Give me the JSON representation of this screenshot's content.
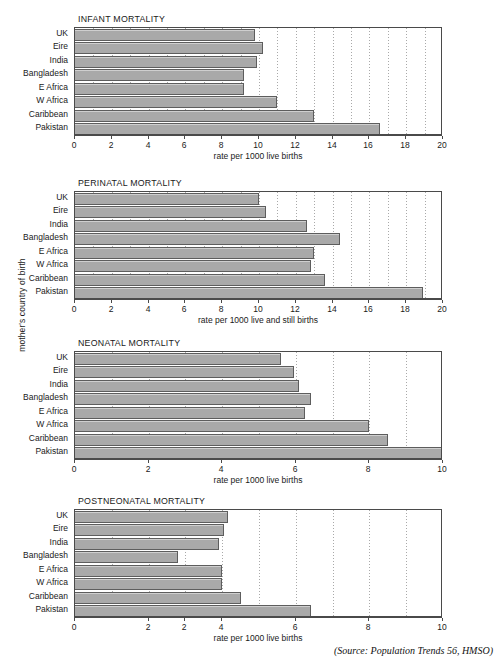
{
  "figure": {
    "y_axis_caption": "mother's country of birth",
    "source_note": "(Source: Population Trends 56, HMSO)",
    "bar_color": "#a9a9a9",
    "bar_border_color": "#5d5d5d",
    "grid_color": "#9a9a9a",
    "axis_color": "#4a4a4a"
  },
  "chart_data": [
    {
      "type": "bar",
      "orientation": "horizontal",
      "title": "INFANT MORTALITY",
      "xlabel": "rate per 1000 live births",
      "ylabel": "mother's country of birth",
      "categories": [
        "UK",
        "Eire",
        "India",
        "Bangladesh",
        "E Africa",
        "W Africa",
        "Caribbean",
        "Pakistan"
      ],
      "values": [
        9.8,
        10.2,
        9.9,
        9.2,
        9.2,
        11.0,
        13.0,
        16.6
      ],
      "xlim": [
        0,
        20
      ],
      "xticks": [
        0,
        2,
        4,
        6,
        8,
        10,
        12,
        14,
        16,
        18,
        20
      ],
      "xtick_labels": [
        "0",
        "2",
        "4",
        "6",
        "8",
        "10",
        "12",
        "14",
        "16",
        "18",
        "20"
      ],
      "grid": true,
      "legend": false
    },
    {
      "type": "bar",
      "orientation": "horizontal",
      "title": "PERINATAL MORTALITY",
      "xlabel": "rate per 1000 live and still births",
      "ylabel": "mother's country of birth",
      "categories": [
        "UK",
        "Eire",
        "India",
        "Bangladesh",
        "E Africa",
        "W Africa",
        "Caribbean",
        "Pakistan"
      ],
      "values": [
        10.0,
        10.4,
        12.6,
        14.4,
        13.0,
        12.85,
        13.6,
        18.9
      ],
      "xlim": [
        0,
        20
      ],
      "xticks": [
        0,
        2,
        4,
        6,
        8,
        10,
        12,
        14,
        16,
        18,
        20
      ],
      "xtick_labels": [
        "0",
        "2",
        "4",
        "6",
        "8",
        "10",
        "12",
        "14",
        "16",
        "18",
        "20"
      ],
      "grid": true,
      "legend": false
    },
    {
      "type": "bar",
      "orientation": "horizontal",
      "title": "NEONATAL MORTALITY",
      "xlabel": "rate per 1000 live births",
      "ylabel": "mother's country of birth",
      "categories": [
        "UK",
        "Eire",
        "India",
        "Bangladesh",
        "E Africa",
        "W Africa",
        "Caribbean",
        "Pakistan"
      ],
      "values": [
        5.6,
        5.95,
        6.1,
        6.4,
        6.25,
        8.0,
        8.5,
        10.1
      ],
      "xlim": [
        0,
        10
      ],
      "xticks": [
        0,
        2,
        4,
        6,
        8,
        10
      ],
      "xtick_labels": [
        "0",
        "2",
        "4",
        "6",
        "8",
        "10"
      ],
      "grid": true,
      "legend": false
    },
    {
      "type": "bar",
      "orientation": "horizontal",
      "title": "POSTNEONATAL MORTALITY",
      "xlabel": "rate per 1000 live births",
      "ylabel": "mother's country of birth",
      "categories": [
        "UK",
        "Eire",
        "India",
        "Bangladesh",
        "E Africa",
        "W Africa",
        "Caribbean",
        "Pakistan"
      ],
      "values": [
        4.15,
        4.05,
        3.9,
        2.8,
        4.0,
        4.0,
        4.5,
        6.4
      ],
      "xlim": [
        0,
        10
      ],
      "xticks": [
        0,
        2,
        3,
        4,
        6,
        8,
        10
      ],
      "xtick_labels": [
        "0",
        "2",
        "2",
        "4",
        "6",
        "8",
        "10"
      ],
      "grid": true,
      "legend": false
    }
  ]
}
